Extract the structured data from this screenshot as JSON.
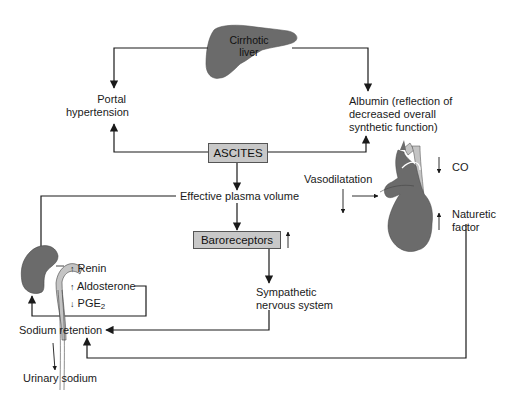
{
  "diagram": {
    "nodes": {
      "liver": {
        "label_line1": "Cirrhotic",
        "label_line2": "liver"
      },
      "portal": {
        "line1": "Portal",
        "line2": "hypertension"
      },
      "albumin": {
        "line1": "Albumin (reflection of",
        "line2": "decreased overall",
        "line3": "synthetic function)"
      },
      "ascites": {
        "label": "ASCITES"
      },
      "plasma": {
        "label": "Effective plasma volume"
      },
      "baroreceptors": {
        "label": "Baroreceptors",
        "indicator": "↑"
      },
      "sympathetic": {
        "line1": "Sympathetic",
        "line2": "nervous system"
      },
      "vasodilatation": {
        "label": "Vasodilatation"
      },
      "co": {
        "label": "CO",
        "indicator": "↓"
      },
      "naturetic": {
        "line1": "Naturetic",
        "line2": "factor",
        "indicator": "↑"
      },
      "renin": {
        "label": "Renin",
        "indicator": "↑"
      },
      "aldosterone": {
        "label": "Aldosterone",
        "indicator": "↑"
      },
      "pge2": {
        "label": "PGE",
        "sub": "2",
        "indicator": "↓"
      },
      "sodium": {
        "label": "Sodium retention"
      },
      "urinary": {
        "label": "Urinary sodium"
      }
    },
    "colors": {
      "organ_dark": "#6b6b6b",
      "organ_light": "#c4c4c4",
      "box_fill": "#c8c8c8",
      "line": "#1a1a1a"
    }
  }
}
